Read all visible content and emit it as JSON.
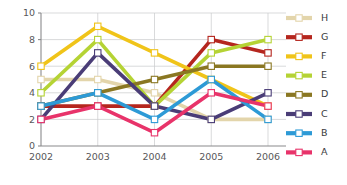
{
  "chart_data": {
    "type": "line",
    "title": "",
    "xlabel": "",
    "ylabel": "",
    "categories": [
      "2002",
      "2003",
      "2004",
      "2005",
      "2006"
    ],
    "x_tick_labels": [
      "2002",
      "2003",
      "2004",
      "2005",
      "2006"
    ],
    "y_tick_labels": [
      "0",
      "2",
      "4",
      "6",
      "8",
      "10"
    ],
    "y_ticks": [
      0,
      2,
      4,
      6,
      8,
      10
    ],
    "ylim": [
      0,
      10
    ],
    "grid": true,
    "legend_position": "right",
    "marker": "square-open",
    "series": [
      {
        "name": "H",
        "color": "#e3d5ab",
        "values": [
          5,
          5,
          4,
          2,
          2
        ]
      },
      {
        "name": "G",
        "color": "#b5261e",
        "values": [
          3,
          3,
          3,
          8,
          7
        ]
      },
      {
        "name": "F",
        "color": "#f0c419",
        "values": [
          6,
          9,
          7,
          5,
          3
        ]
      },
      {
        "name": "E",
        "color": "#b5d334",
        "values": [
          4,
          8,
          3,
          7,
          8
        ]
      },
      {
        "name": "D",
        "color": "#8a7722",
        "values": [
          3,
          4,
          5,
          6,
          6
        ]
      },
      {
        "name": "C",
        "color": "#4a3d77",
        "values": [
          2,
          7,
          3,
          2,
          4
        ]
      },
      {
        "name": "B",
        "color": "#2d9ad6",
        "values": [
          3,
          4,
          2,
          5,
          2
        ]
      },
      {
        "name": "A",
        "color": "#e8336a",
        "values": [
          2,
          3,
          1,
          4,
          3
        ]
      }
    ],
    "legend_entries": [
      {
        "label": "H",
        "color": "#e3d5ab"
      },
      {
        "label": "G",
        "color": "#b5261e"
      },
      {
        "label": "F",
        "color": "#f0c419"
      },
      {
        "label": "E",
        "color": "#b5d334"
      },
      {
        "label": "D",
        "color": "#8a7722"
      },
      {
        "label": "C",
        "color": "#4a3d77"
      },
      {
        "label": "B",
        "color": "#2d9ad6"
      },
      {
        "label": "A",
        "color": "#e8336a"
      }
    ]
  },
  "colors": {
    "background": "#ffffff",
    "grid": "#c9cacc",
    "axis": "#8a8a8c",
    "tick_text": "#58585a",
    "legend_text": "#3a3a3c"
  }
}
